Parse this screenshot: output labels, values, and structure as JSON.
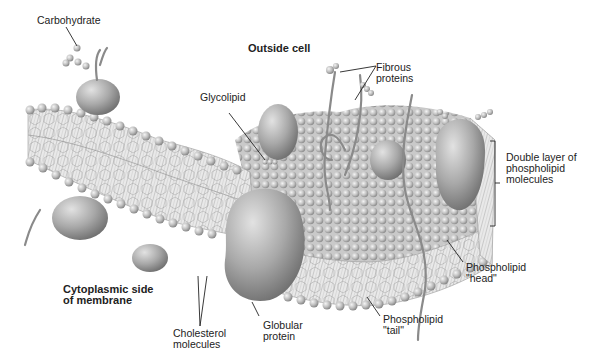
{
  "diagram": {
    "regions": {
      "outside": "Outside cell",
      "inside_line1": "Cytoplasmic side",
      "inside_line2": "of membrane"
    },
    "labels": {
      "carbohydrate": "Carbohydrate",
      "glycolipid": "Glycolipid",
      "fibrous_1": "Fibrous",
      "fibrous_2": "proteins",
      "double_layer_1": "Double layer of",
      "double_layer_2": "phospholipid",
      "double_layer_3": "molecules",
      "head_1": "Phospholipid",
      "head_2": "\"head\"",
      "tail_1": "Phospholipid",
      "tail_2": "\"tail\"",
      "globular_1": "Globular",
      "globular_2": "protein",
      "cholesterol_1": "Cholesterol",
      "cholesterol_2": "molecules"
    },
    "colors": {
      "background": "#ffffff",
      "membrane_light": "#e6e6e6",
      "membrane_mid": "#c4c4c4",
      "membrane_dark": "#8f8f8f",
      "leader_line": "#222222"
    }
  }
}
